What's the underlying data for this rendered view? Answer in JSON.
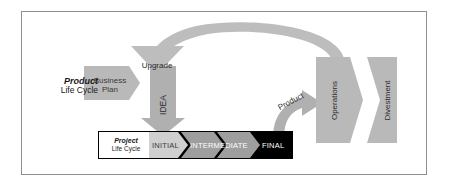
{
  "diagram": {
    "frame_border_color": "#8e8e8e",
    "background_color": "#ffffff"
  },
  "product_lane": {
    "label_bold": "Product",
    "label_normal": "Life Cycle",
    "business_plan": {
      "line1": "Business",
      "line2": "Plan",
      "shape": "right-chevron",
      "fill": "#b9b9b9"
    },
    "idea": {
      "label": "IDEA",
      "shape": "down-arrow",
      "fill": "#b0b0b0"
    },
    "operations": {
      "label": "Operations",
      "shape": "right-chevron",
      "fill": "#b9b9b9"
    },
    "divestment": {
      "label": "Divestment",
      "shape": "right-chevron",
      "fill": "#b9b9b9"
    }
  },
  "connectors": {
    "upgrade": {
      "label": "Upgrade",
      "shape": "curved-arc-arrow-down",
      "fill": "#bdbdbd"
    },
    "product": {
      "label": "Product",
      "shape": "curved-arrow-up-right",
      "fill": "#b0b0b0"
    }
  },
  "project_lane": {
    "label_bold": "Project",
    "label_normal": "Life Cycle",
    "bar_fill": "#000000",
    "stages": [
      {
        "label": "INITIAL",
        "fill": "#cfcfcf",
        "text_color": "#3a3a3a"
      },
      {
        "label": "INTERMEDIATE",
        "fill": "#9e9e9e",
        "text_color": "#ffffff"
      },
      {
        "label": "FINAL",
        "fill": "#000000",
        "text_color": "#ffffff"
      }
    ]
  },
  "colors": {
    "light_gray": "#cfcfcf",
    "mid_gray": "#9e9e9e",
    "shape_gray": "#b9b9b9",
    "black": "#000000",
    "white": "#ffffff",
    "border_gray": "#8e8e8e"
  }
}
